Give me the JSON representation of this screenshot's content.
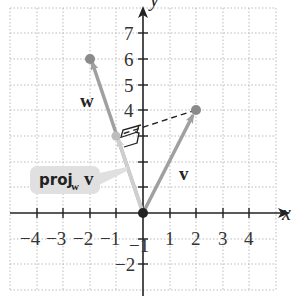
{
  "diagram": {
    "axes": {
      "x_label": "x",
      "y_label": "y",
      "x_ticks": [
        "-4",
        "-3",
        "-2",
        "-1",
        "1",
        "2",
        "3",
        "4"
      ],
      "y_ticks": [
        "7",
        "6",
        "5",
        "4",
        "3",
        "2",
        "1",
        "-1",
        "-2"
      ],
      "x_range": [
        -5,
        5
      ],
      "y_range": [
        -3,
        8
      ]
    },
    "vectors": {
      "v": {
        "label": "v",
        "tail": [
          0,
          0
        ],
        "head": [
          2,
          4
        ]
      },
      "w": {
        "label": "w",
        "tail": [
          0,
          0
        ],
        "head": [
          -2,
          6
        ]
      },
      "proj": {
        "label_main": "proj",
        "label_sub": "w",
        "label_vec": "v",
        "head": [
          -1,
          3
        ]
      }
    },
    "colors": {
      "vector": "#a0a0a0",
      "proj_vector": "#cfcfcf",
      "point": "#8a8a8a",
      "axis": "#222222",
      "grid": "#bbbbbb",
      "label_bubble": "#e0e0e0"
    }
  }
}
